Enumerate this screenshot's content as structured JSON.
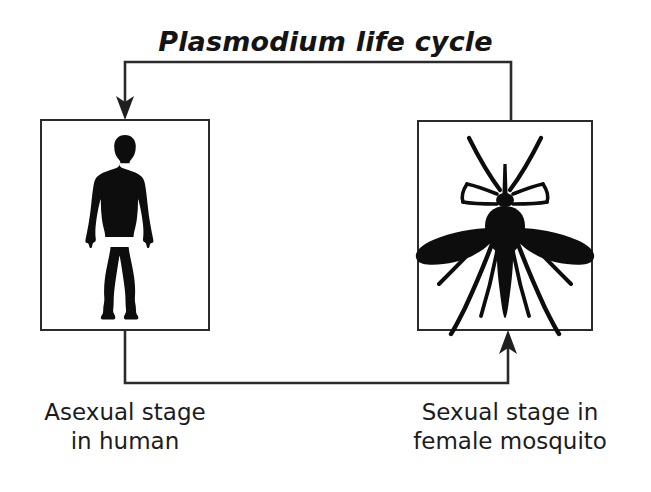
{
  "diagram": {
    "title": "Plasmodium life cycle",
    "background_color": "#ffffff",
    "ink_color": "#1a1a1a",
    "stages": [
      {
        "id": "human",
        "figure": "human-silhouette",
        "caption_line1": "Asexual stage",
        "caption_line2": "in human"
      },
      {
        "id": "mosquito",
        "figure": "mosquito-silhouette",
        "caption_line1": "Sexual stage in",
        "caption_line2": "female mosquito"
      }
    ],
    "connectors": [
      {
        "id": "mosquito-to-human",
        "from": "mosquito",
        "to": "human",
        "direction": "leftward-top",
        "arrowhead": "down-into-human-box"
      },
      {
        "id": "human-to-mosquito",
        "from": "human",
        "to": "mosquito",
        "direction": "rightward-bottom",
        "arrowhead": "up-into-mosquito-box"
      }
    ]
  }
}
